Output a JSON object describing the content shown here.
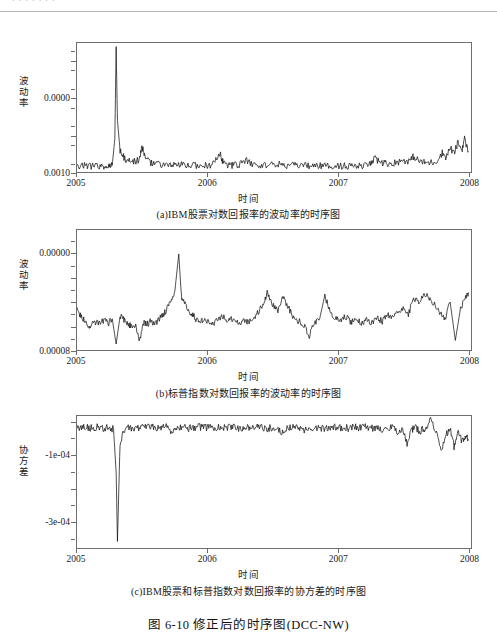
{
  "page": {
    "header_text": "· · ·  · · · ·",
    "figure_title": "图 6-10   修正后的时序图(DCC-NW)",
    "background": "#ffffff",
    "line_color": "#111111",
    "axis_color": "#6e6e6e"
  },
  "panels": [
    {
      "id": "a",
      "caption": "(a)IBM股票对数回报率的波动率的时序图",
      "xlabel": "时间",
      "ylabel": "波动率",
      "yticks": [
        "0.0010",
        "0.0000"
      ]
    },
    {
      "id": "b",
      "caption": "(b)标普指数对数回报率的波动率的时序图",
      "xlabel": "时间",
      "ylabel": "波动率",
      "yticks": [
        "0.00008",
        "0.00000"
      ]
    },
    {
      "id": "c",
      "caption": "(c)IBM股票和标普指数对数回报率的协方差的时序图",
      "xlabel": "时间",
      "ylabel": "协方差",
      "yticks": [
        "-1e-04",
        "-3e-04"
      ]
    }
  ],
  "chart_data": [
    {
      "type": "line",
      "panel": "a",
      "title": "(a)IBM股票对数回报率的波动率的时序图",
      "xlabel": "时间",
      "ylabel": "波动率",
      "xticks": [
        "2005",
        "2006",
        "2007",
        "2008"
      ],
      "xlim": [
        2005.0,
        2008.02
      ],
      "ylim": [
        0.0,
        0.00175
      ],
      "yticks_values": [
        0.0,
        0.0005,
        0.001,
        0.0015
      ],
      "yticks_labeled": [
        0.0,
        0.001
      ],
      "grid": false,
      "legend": "none",
      "annotations": [
        "baseline volatility ≈ 0.00008 through most of the sample",
        "single dominant spike ≈ 0.00170 in early-mid 2005 (around 2005.3)",
        "secondary spikes ≈ 0.00035 near 2005.5 and ≈ 0.00025 near 2006.1",
        "volatility clustering and rise to ≈ 0.00045 during late 2007 - early 2008"
      ],
      "series": [
        {
          "name": "IBM volatility",
          "x": [
            2005.0,
            2005.04,
            2005.08,
            2005.12,
            2005.16,
            2005.2,
            2005.24,
            2005.27,
            2005.29,
            2005.3,
            2005.31,
            2005.33,
            2005.36,
            2005.4,
            2005.44,
            2005.48,
            2005.5,
            2005.52,
            2005.56,
            2005.6,
            2005.65,
            2005.7,
            2005.75,
            2005.8,
            2005.85,
            2005.9,
            2005.95,
            2006.0,
            2006.05,
            2006.1,
            2006.12,
            2006.16,
            2006.2,
            2006.25,
            2006.3,
            2006.35,
            2006.4,
            2006.45,
            2006.5,
            2006.55,
            2006.6,
            2006.65,
            2006.7,
            2006.75,
            2006.8,
            2006.85,
            2006.9,
            2006.95,
            2007.0,
            2007.05,
            2007.1,
            2007.15,
            2007.2,
            2007.25,
            2007.28,
            2007.32,
            2007.36,
            2007.4,
            2007.45,
            2007.5,
            2007.55,
            2007.58,
            2007.62,
            2007.66,
            2007.7,
            2007.75,
            2007.8,
            2007.83,
            2007.86,
            2007.89,
            2007.92,
            2007.95,
            2007.97,
            2008.0
          ],
          "y": [
            8.5e-05,
            8.2e-05,
            9e-05,
            8e-05,
            8.5e-05,
            7.8e-05,
            8.2e-05,
            9e-05,
            0.00045,
            0.0017,
            0.0007,
            0.0003,
            0.00019,
            0.00015,
            0.00014,
            0.000175,
            0.00035,
            0.00019,
            0.00013,
            0.00011,
            0.0001,
            9.5e-05,
            9e-05,
            9.2e-05,
            8.8e-05,
            9.5e-05,
            8.5e-05,
            9e-05,
            0.00011,
            0.00025,
            0.00012,
            9.5e-05,
            9e-05,
            0.000105,
            0.00015,
            0.0001,
            9e-05,
            9.5e-05,
            0.00011,
            0.0001,
            9e-05,
            8.5e-05,
            9e-05,
            8.8e-05,
            8.2e-05,
            8.5e-05,
            8e-05,
            8.2e-05,
            8.5e-05,
            8e-05,
            8.2e-05,
            7.8e-05,
            8e-05,
            0.00011,
            0.00018,
            0.00014,
            0.00012,
            0.000115,
            0.00013,
            0.00016,
            0.00015,
            0.00021,
            0.00015,
            0.00013,
            0.000125,
            0.00014,
            0.00026,
            0.0002,
            0.00033,
            0.00025,
            0.0004,
            0.0003,
            0.00045,
            0.00028
          ]
        }
      ]
    },
    {
      "type": "line",
      "panel": "b",
      "title": "(b)标普指数对数回报率的波动率的时序图",
      "xlabel": "时间",
      "ylabel": "波动率",
      "xticks": [
        "2005",
        "2006",
        "2007",
        "2008"
      ],
      "xlim": [
        2005.0,
        2008.02
      ],
      "ylim": [
        0.0,
        0.0001
      ],
      "yticks_values": [
        0.0,
        2e-05,
        4e-05,
        6e-05,
        8e-05
      ],
      "yticks_labeled": [
        0.0,
        8e-05
      ],
      "grid": false,
      "legend": "none",
      "annotations": [
        "noisy band oscillating roughly between 0.000015 and 0.000035",
        "tall narrow spike to ≈ 0.00008 near late 2005 (≈2005.8)",
        "downward spikes to near 0.000005 at ≈2005.3 and ≈2005.5",
        "elevated choppiness in 2007 with peaks ≈ 0.00005"
      ],
      "series": [
        {
          "name": "S&P volatility",
          "x": [
            2005.0,
            2005.03,
            2005.06,
            2005.09,
            2005.12,
            2005.15,
            2005.18,
            2005.21,
            2005.24,
            2005.27,
            2005.3,
            2005.33,
            2005.36,
            2005.39,
            2005.42,
            2005.45,
            2005.48,
            2005.51,
            2005.54,
            2005.57,
            2005.6,
            2005.63,
            2005.66,
            2005.69,
            2005.72,
            2005.75,
            2005.78,
            2005.8,
            2005.82,
            2005.85,
            2005.88,
            2005.91,
            2005.94,
            2005.97,
            2006.0,
            2006.04,
            2006.08,
            2006.12,
            2006.16,
            2006.2,
            2006.24,
            2006.28,
            2006.32,
            2006.36,
            2006.4,
            2006.44,
            2006.46,
            2006.5,
            2006.54,
            2006.58,
            2006.62,
            2006.66,
            2006.7,
            2006.74,
            2006.78,
            2006.82,
            2006.86,
            2006.9,
            2006.94,
            2006.98,
            2007.02,
            2007.06,
            2007.1,
            2007.14,
            2007.18,
            2007.22,
            2007.26,
            2007.3,
            2007.34,
            2007.38,
            2007.42,
            2007.46,
            2007.5,
            2007.54,
            2007.58,
            2007.62,
            2007.66,
            2007.7,
            2007.74,
            2007.78,
            2007.82,
            2007.86,
            2007.9,
            2007.94,
            2007.98,
            2008.0
          ],
          "y": [
            3.3e-05,
            2.9e-05,
            2.4e-05,
            1.9e-05,
            2.2e-05,
            2.4e-05,
            2.2e-05,
            2.5e-05,
            2.2e-05,
            2.6e-05,
            5e-06,
            2.8e-05,
            2.5e-05,
            2.1e-05,
            2e-05,
            1.9e-05,
            7e-06,
            2.3e-05,
            2.2e-05,
            2.4e-05,
            2.2e-05,
            2.6e-05,
            3e-05,
            3.4e-05,
            4.2e-05,
            4.9e-05,
            8e-05,
            4.5e-05,
            3.9e-05,
            3.4e-05,
            3e-05,
            2.6e-05,
            2.3e-05,
            2.6e-05,
            2.4e-05,
            2.1e-05,
            2.5e-05,
            2.8e-05,
            2.4e-05,
            2.7e-05,
            2.2e-05,
            2.5e-05,
            2.3e-05,
            2.8e-05,
            3.3e-05,
            4.2e-05,
            4.8e-05,
            3.8e-05,
            3.3e-05,
            4.4e-05,
            3.6e-05,
            2.6e-05,
            2.4e-05,
            2.1e-05,
            1.2e-05,
            2.3e-05,
            2.6e-05,
            4.6e-05,
            3.1e-05,
            2.6e-05,
            2.4e-05,
            2.8e-05,
            2.3e-05,
            2.6e-05,
            2.2e-05,
            2.5e-05,
            2.3e-05,
            2.7e-05,
            2.4e-05,
            2.9e-05,
            2.6e-05,
            3.1e-05,
            3.6e-05,
            2.9e-05,
            4.4e-05,
            3.8e-05,
            4.8e-05,
            4.4e-05,
            3.8e-05,
            3.1e-05,
            2.6e-05,
            4e-05,
            8e-06,
            3.5e-05,
            4.3e-05,
            4.8e-05
          ]
        }
      ]
    },
    {
      "type": "line",
      "panel": "c",
      "title": "(c)IBM股票和标普指数对数回报率的协方差的时序图",
      "xlabel": "时间",
      "ylabel": "协方差",
      "xticks": [
        "2005",
        "2006",
        "2007",
        "2008"
      ],
      "xlim": [
        2005.0,
        2008.02
      ],
      "ylim": [
        -0.00038,
        2e-05
      ],
      "yticks_values": [
        -0.0003,
        -0.0002,
        -0.0001,
        0.0
      ],
      "yticks_labeled": [
        -0.0001,
        -0.0003
      ],
      "grid": false,
      "legend": "none",
      "annotations": [
        "series hovers just below zero, around -0.000015",
        "one very deep downward spike to ≈ -0.00036 at ≈2005.3",
        "moderate negative excursions to ≈ -0.00009 in late 2007",
        "increased variability during late 2007 - early 2008"
      ],
      "series": [
        {
          "name": "IBM / S&P covariance",
          "x": [
            2005.0,
            2005.04,
            2005.08,
            2005.12,
            2005.16,
            2005.2,
            2005.24,
            2005.28,
            2005.3,
            2005.31,
            2005.33,
            2005.37,
            2005.41,
            2005.45,
            2005.49,
            2005.53,
            2005.57,
            2005.61,
            2005.65,
            2005.69,
            2005.73,
            2005.77,
            2005.81,
            2005.85,
            2005.89,
            2005.93,
            2005.97,
            2006.01,
            2006.05,
            2006.09,
            2006.13,
            2006.17,
            2006.21,
            2006.25,
            2006.29,
            2006.33,
            2006.37,
            2006.41,
            2006.45,
            2006.49,
            2006.53,
            2006.57,
            2006.61,
            2006.65,
            2006.69,
            2006.73,
            2006.77,
            2006.81,
            2006.85,
            2006.89,
            2006.93,
            2006.97,
            2007.01,
            2007.05,
            2007.09,
            2007.13,
            2007.17,
            2007.21,
            2007.25,
            2007.29,
            2007.33,
            2007.37,
            2007.41,
            2007.45,
            2007.49,
            2007.53,
            2007.57,
            2007.59,
            2007.63,
            2007.67,
            2007.71,
            2007.75,
            2007.79,
            2007.83,
            2007.86,
            2007.89,
            2007.92,
            2007.95,
            2007.98,
            2008.0
          ],
          "y": [
            -1.4e-05,
            -1.6e-05,
            -1.3e-05,
            -1.8e-05,
            -1.2e-05,
            -1.7e-05,
            -1.4e-05,
            -2e-05,
            -0.00015,
            -0.00036,
            -6e-05,
            -1.8e-05,
            -1.4e-05,
            -2.2e-05,
            -1.2e-05,
            -1.6e-05,
            -1.3e-05,
            -1.7e-05,
            -1.4e-05,
            -1.2e-05,
            -3e-05,
            -1.6e-05,
            -1.3e-05,
            -1.8e-05,
            -1.5e-05,
            -1.2e-05,
            -1.6e-05,
            -1.4e-05,
            -1.8e-05,
            -1.3e-05,
            -1.6e-05,
            -1.1e-05,
            -1.5e-05,
            -1.8e-05,
            -1.3e-05,
            -1.6e-05,
            -1.2e-05,
            -1.4e-05,
            -1.8e-05,
            -1.5e-05,
            -1.3e-05,
            -3.2e-05,
            -1.6e-05,
            -1.3e-05,
            -1.7e-05,
            -2.6e-05,
            -1.4e-05,
            -1.6e-05,
            -1.3e-05,
            -1.8e-05,
            -1.5e-05,
            -1.2e-05,
            -1.6e-05,
            -1.4e-05,
            -1.8e-05,
            -1.3e-05,
            -1.6e-05,
            -1.2e-05,
            -1.8e-05,
            -1.5e-05,
            -2.2e-05,
            -1.6e-05,
            -1.3e-05,
            -2.8e-05,
            -1.8e-05,
            -6.2e-05,
            -2e-05,
            -1.4e-05,
            -2.6e-05,
            -1.6e-05,
            8e-06,
            -2.4e-05,
            -9e-05,
            -3.6e-05,
            -1.8e-05,
            -7.2e-05,
            -3e-05,
            -5.5e-05,
            -4.2e-05,
            -5e-05
          ]
        }
      ]
    }
  ]
}
